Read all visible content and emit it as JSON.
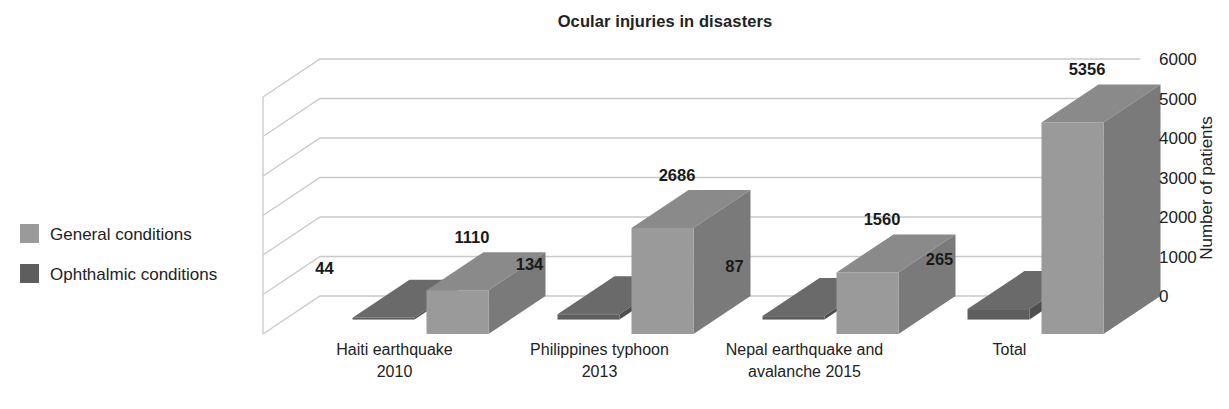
{
  "chart_data": {
    "type": "bar",
    "title": "Ocular injuries in disasters",
    "xlabel": "",
    "ylabel": "Number of patients",
    "ylim": [
      0,
      6000
    ],
    "yticks": [
      0,
      1000,
      2000,
      3000,
      4000,
      5000,
      6000
    ],
    "ytick_labels": [
      "0",
      "1000",
      "2000",
      "3000",
      "4000",
      "5000",
      "6000"
    ],
    "grid": true,
    "legend_position": "left",
    "style": "3d-grouped-column",
    "categories": [
      "Haiti earthquake 2010",
      "Philippines typhoon 2013",
      "Nepal earthquake and avalanche 2015",
      "Total"
    ],
    "category_lines": [
      [
        "Haiti earthquake",
        "2010"
      ],
      [
        "Philippines typhoon",
        "2013"
      ],
      [
        "Nepal earthquake and",
        "avalanche 2015"
      ],
      [
        "Total",
        ""
      ]
    ],
    "series": [
      {
        "name": "Ophthalmic conditions",
        "color": "#5e5e5e",
        "values": [
          44,
          134,
          87,
          265
        ],
        "labels": [
          "44",
          "134",
          "87",
          "265"
        ]
      },
      {
        "name": "General conditions",
        "color": "#9a9a9a",
        "values": [
          1110,
          2686,
          1560,
          5356
        ],
        "labels": [
          "1110",
          "2686",
          "1560",
          "5356"
        ]
      }
    ]
  },
  "legend": {
    "items": [
      {
        "label": "General conditions",
        "color": "#9a9a9a"
      },
      {
        "label": "Ophthalmic conditions",
        "color": "#5e5e5e"
      }
    ]
  },
  "colors": {
    "general_front": "#9a9a9a",
    "general_side": "#7a7a7a",
    "general_top": "#8a8a8a",
    "ophthalmic_front": "#5e5e5e",
    "ophthalmic_side": "#4e4e4e",
    "ophthalmic_top": "#6a6a6a",
    "gridline": "#c9c9c9",
    "text": "#222222",
    "background": "#ffffff"
  }
}
